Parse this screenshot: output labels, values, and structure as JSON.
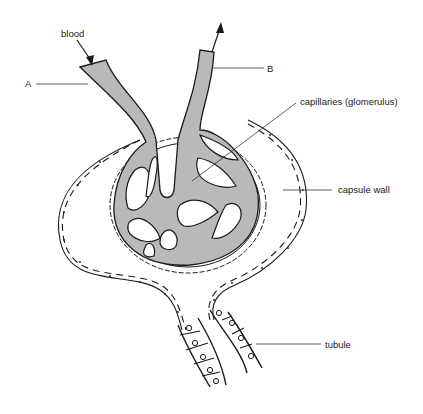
{
  "diagram": {
    "labels": {
      "blood": "blood",
      "a": "A",
      "b": "B",
      "capillaries": "capillaries (glomerulus)",
      "capsule_wall": "capsule wall",
      "tubule": "tubule"
    },
    "colors": {
      "vessel_fill": "#b9b9b9",
      "line": "#1a1a1a",
      "background": "#ffffff"
    }
  }
}
